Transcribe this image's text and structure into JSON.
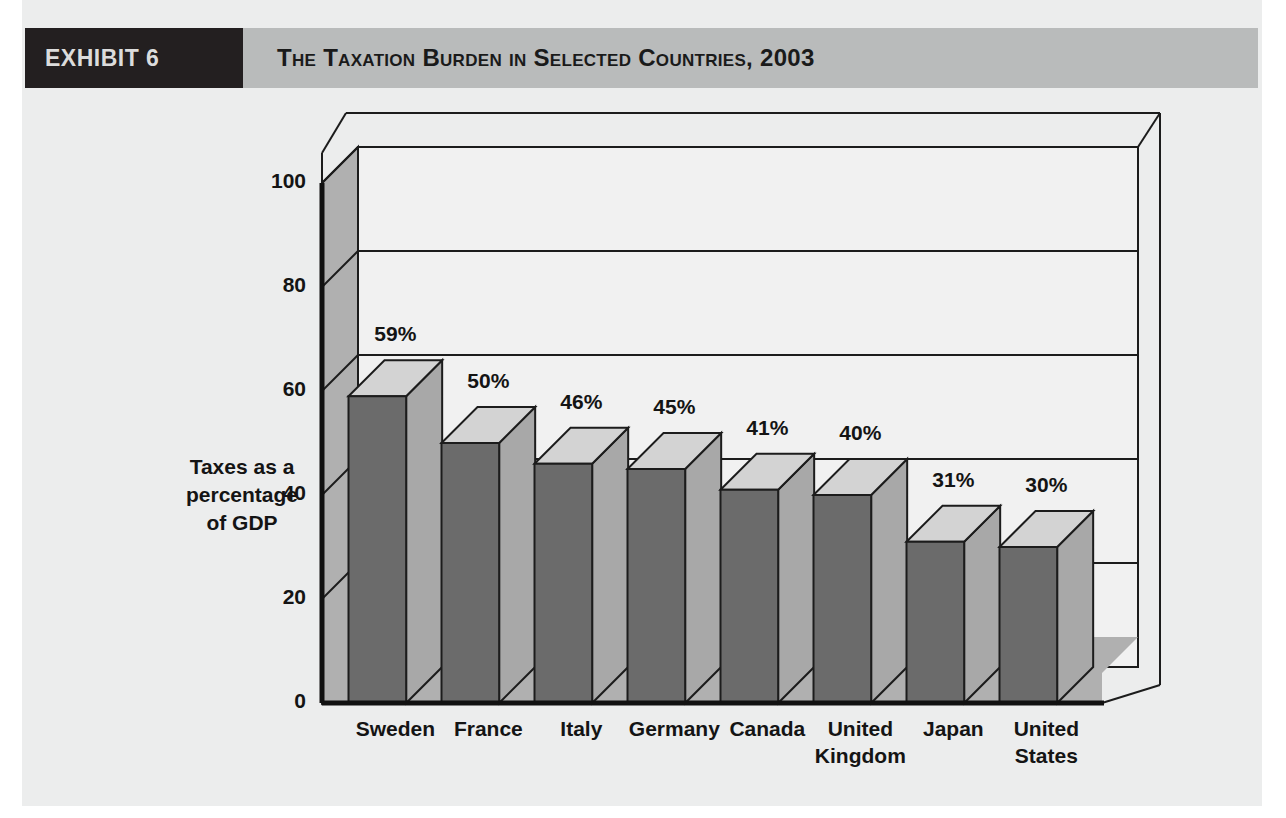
{
  "exhibit": {
    "tag": "EXHIBIT 6",
    "title": "The Taxation Burden in Selected Countries, 2003"
  },
  "colors": {
    "tag_background": "#231f20",
    "tag_text": "#dcdcdc",
    "header_band": "#b9bbbb",
    "paper": "#eceded",
    "bar_front": "#6b6b6b",
    "bar_top": "#d3d3d3",
    "bar_side": "#a8a8a8",
    "plot_back_wall": "#f1f1f1",
    "plot_side_wall": "#b0b0b0",
    "plot_floor": "#b0b0b0",
    "gridline": "#1c1c1c",
    "axis": "#111111",
    "text": "#141414"
  },
  "chart_data": {
    "type": "bar",
    "title": "The Taxation Burden in Selected Countries, 2003",
    "xlabel": "Country",
    "ylabel": "Taxes as a percentage of GDP",
    "ylabel_lines": [
      "Taxes as a",
      "percentage",
      "of GDP"
    ],
    "categories": [
      "Sweden",
      "France",
      "Italy",
      "Germany",
      "Canada",
      "United Kingdom",
      "Japan",
      "United States"
    ],
    "category_lines": [
      [
        "Sweden"
      ],
      [
        "France"
      ],
      [
        "Italy"
      ],
      [
        "Germany"
      ],
      [
        "Canada"
      ],
      [
        "United",
        "Kingdom"
      ],
      [
        "Japan"
      ],
      [
        "United",
        "States"
      ]
    ],
    "values": [
      59,
      50,
      46,
      45,
      41,
      40,
      31,
      30
    ],
    "value_labels": [
      "59%",
      "50%",
      "46%",
      "45%",
      "41%",
      "40%",
      "31%",
      "30%"
    ],
    "ylim": [
      0,
      100
    ],
    "yticks": [
      0,
      20,
      40,
      60,
      80,
      100
    ],
    "ytick_labels": [
      "0",
      "20",
      "40",
      "60",
      "80",
      "100"
    ],
    "grid": true,
    "legend": "none",
    "style": "3d-column"
  }
}
